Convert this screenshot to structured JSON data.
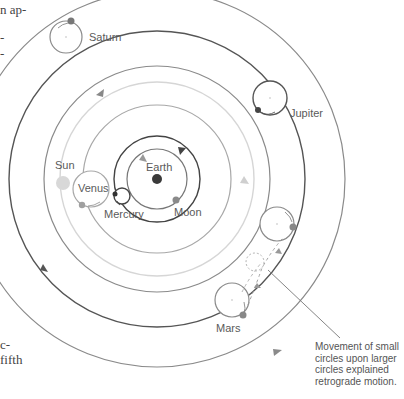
{
  "margin_text": {
    "top_lines": [
      "n ap-",
      "-",
      "-"
    ],
    "bottom_lines": [
      "c-",
      "fifth"
    ]
  },
  "labels": {
    "saturn": "Saturn",
    "jupiter": "Jupiter",
    "sun": "Sun",
    "venus": "Venus",
    "mercury": "Mercury",
    "earth": "Earth",
    "moon": "Moon",
    "mars": "Mars"
  },
  "caption": {
    "lines": [
      "Movement of small",
      "circles upon larger",
      "circles explained",
      "retrograde motion."
    ]
  },
  "colors": {
    "orbit_dark": "#555555",
    "orbit_mid": "#8a8a8a",
    "orbit_light": "#cfcfcf",
    "planet_gray": "#9a9a9a",
    "earth": "#3a3a3a",
    "sun": "#d8d8d8"
  }
}
